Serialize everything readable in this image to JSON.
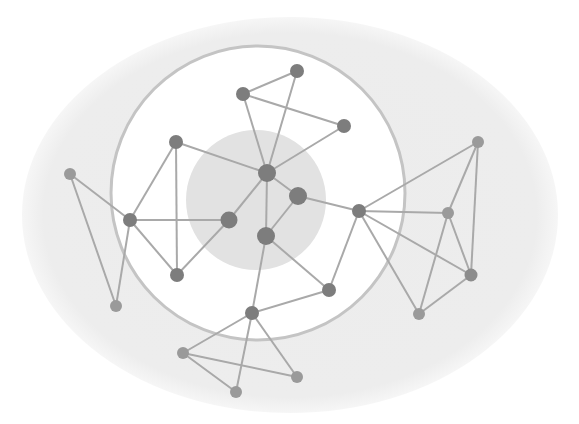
{
  "diagram": {
    "type": "network",
    "colors": {
      "background": "#ffffff",
      "outer_ellipse": "#ededed",
      "ring_fill": "#ffffff",
      "ring_stroke": "#c4c4c4",
      "inner_disc": "#e2e2e2",
      "edge": "#a9a9a9",
      "node_dark": "#7d7d7d",
      "node_mid": "#8c8c8c",
      "node_light": "#9a9a9a"
    },
    "regions": {
      "outer_ellipse": {
        "cx": 290,
        "cy": 215,
        "rx": 268,
        "ry": 198
      },
      "ring": {
        "cx": 258,
        "cy": 193,
        "rx": 147,
        "ry": 147
      },
      "inner_disc": {
        "cx": 256,
        "cy": 200,
        "r": 70
      }
    },
    "nodes": [
      {
        "id": "c1",
        "x": 267,
        "y": 173,
        "r": 9,
        "tone": "dark"
      },
      {
        "id": "c2",
        "x": 298,
        "y": 196,
        "r": 9,
        "tone": "dark"
      },
      {
        "id": "c3",
        "x": 266,
        "y": 236,
        "r": 9,
        "tone": "dark"
      },
      {
        "id": "c4",
        "x": 229,
        "y": 220,
        "r": 8.5,
        "tone": "dark"
      },
      {
        "id": "t1",
        "x": 297,
        "y": 71,
        "r": 7,
        "tone": "dark"
      },
      {
        "id": "t2",
        "x": 243,
        "y": 94,
        "r": 7,
        "tone": "dark"
      },
      {
        "id": "t3",
        "x": 344,
        "y": 126,
        "r": 7,
        "tone": "dark"
      },
      {
        "id": "l1",
        "x": 176,
        "y": 142,
        "r": 7,
        "tone": "dark"
      },
      {
        "id": "l2",
        "x": 130,
        "y": 220,
        "r": 7,
        "tone": "dark"
      },
      {
        "id": "l3",
        "x": 177,
        "y": 275,
        "r": 7,
        "tone": "dark"
      },
      {
        "id": "l4",
        "x": 70,
        "y": 174,
        "r": 6,
        "tone": "light"
      },
      {
        "id": "l5",
        "x": 116,
        "y": 306,
        "r": 6,
        "tone": "light"
      },
      {
        "id": "r0",
        "x": 359,
        "y": 211,
        "r": 7,
        "tone": "dark"
      },
      {
        "id": "r1",
        "x": 478,
        "y": 142,
        "r": 6,
        "tone": "light"
      },
      {
        "id": "r2",
        "x": 448,
        "y": 213,
        "r": 6,
        "tone": "light"
      },
      {
        "id": "r3",
        "x": 471,
        "y": 275,
        "r": 6.5,
        "tone": "mid"
      },
      {
        "id": "r4",
        "x": 419,
        "y": 314,
        "r": 6,
        "tone": "light"
      },
      {
        "id": "b0",
        "x": 252,
        "y": 313,
        "r": 7,
        "tone": "dark"
      },
      {
        "id": "b1",
        "x": 329,
        "y": 290,
        "r": 7,
        "tone": "dark"
      },
      {
        "id": "b2",
        "x": 183,
        "y": 353,
        "r": 6,
        "tone": "light"
      },
      {
        "id": "b3",
        "x": 236,
        "y": 392,
        "r": 6,
        "tone": "light"
      },
      {
        "id": "b4",
        "x": 297,
        "y": 377,
        "r": 6,
        "tone": "light"
      }
    ],
    "edges": [
      [
        "c1",
        "c2"
      ],
      [
        "c2",
        "c3"
      ],
      [
        "c1",
        "c3"
      ],
      [
        "c1",
        "c4"
      ],
      [
        "c1",
        "t1"
      ],
      [
        "c1",
        "t2"
      ],
      [
        "c1",
        "t3"
      ],
      [
        "t1",
        "t2"
      ],
      [
        "t2",
        "t3"
      ],
      [
        "c1",
        "l1"
      ],
      [
        "l1",
        "l2"
      ],
      [
        "l1",
        "l3"
      ],
      [
        "l2",
        "c4"
      ],
      [
        "l2",
        "l3"
      ],
      [
        "l3",
        "c4"
      ],
      [
        "l4",
        "l2"
      ],
      [
        "l4",
        "l5"
      ],
      [
        "l2",
        "l5"
      ],
      [
        "c2",
        "r0"
      ],
      [
        "r0",
        "r1"
      ],
      [
        "r0",
        "r2"
      ],
      [
        "r0",
        "r3"
      ],
      [
        "r0",
        "r4"
      ],
      [
        "r1",
        "r2"
      ],
      [
        "r1",
        "r3"
      ],
      [
        "r2",
        "r3"
      ],
      [
        "r2",
        "r4"
      ],
      [
        "r3",
        "r4"
      ],
      [
        "c3",
        "b1"
      ],
      [
        "b1",
        "r0"
      ],
      [
        "c3",
        "b0"
      ],
      [
        "b0",
        "b1"
      ],
      [
        "b0",
        "b2"
      ],
      [
        "b0",
        "b3"
      ],
      [
        "b0",
        "b4"
      ],
      [
        "b2",
        "b3"
      ],
      [
        "b2",
        "b4"
      ]
    ]
  }
}
